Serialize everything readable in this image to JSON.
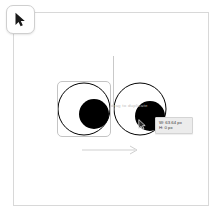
{
  "app": {
    "surface_label": "design-canvas",
    "background_color": "#ffffff",
    "frame_border_color": "#d8d8d8"
  },
  "toolbar": {
    "active_tool": "pointer",
    "pointer_tool_label": "Pointer",
    "pointer_icon": "cursor-arrow-icon"
  },
  "canvas": {
    "guide": {
      "orientation": "vertical",
      "color": "#c9c9c9"
    },
    "distance_arrow": {
      "direction": "right",
      "color": "#cfcfcf",
      "icon": "arrow-right-icon"
    },
    "hint_text": "drag to duplicate",
    "selection": {
      "target": "left-eye",
      "border_color": "#c4c4c4"
    },
    "shapes": [
      {
        "name": "left-eye",
        "type": "googly-eye",
        "eye_fill": "#ffffff",
        "eye_stroke": "#000000",
        "pupil_fill": "#000000",
        "cx": 84,
        "cy": 109,
        "r": 26,
        "pupil_cx": 94,
        "pupil_cy": 114,
        "pupil_r": 15
      },
      {
        "name": "right-eye",
        "type": "googly-eye",
        "eye_fill": "#ffffff",
        "eye_stroke": "#000000",
        "pupil_fill": "#000000",
        "cx": 140,
        "cy": 109,
        "r": 26,
        "pupil_cx": 150,
        "pupil_cy": 116,
        "pupil_r": 15
      }
    ]
  },
  "cursor": {
    "icon": "cursor-arrow-icon",
    "x": 138,
    "y": 119
  },
  "measurement_tooltip": {
    "width_label": "W: 63.64 px",
    "height_label": "H: 0 px",
    "background": "#ececec",
    "text_color": "#3a3a3a"
  }
}
